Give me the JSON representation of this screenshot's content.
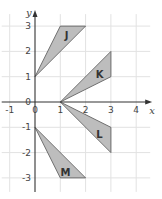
{
  "diagram": {
    "type": "coordinate-grid",
    "x_axis": {
      "label": "x",
      "range": [
        -1,
        4
      ],
      "ticks": [
        "-1",
        "0",
        "1",
        "2",
        "3",
        "4"
      ],
      "tick_values": [
        -1,
        0,
        1,
        2,
        3,
        4
      ]
    },
    "y_axis": {
      "label": "y",
      "range": [
        -3,
        3
      ],
      "ticks": [
        "-3",
        "-2",
        "-1",
        "0",
        "1",
        "2",
        "3"
      ],
      "tick_values": [
        -3,
        -2,
        -1,
        0,
        1,
        2,
        3
      ]
    },
    "shape_fill": "#bdbdbd",
    "shapes": [
      {
        "name": "J",
        "vertices": [
          [
            0,
            1
          ],
          [
            1,
            3
          ],
          [
            2,
            3
          ]
        ],
        "label_at": [
          1.25,
          2.6
        ]
      },
      {
        "name": "K",
        "vertices": [
          [
            1,
            0
          ],
          [
            3,
            2
          ],
          [
            3,
            1
          ]
        ],
        "label_at": [
          2.55,
          1.05
        ]
      },
      {
        "name": "L",
        "vertices": [
          [
            1,
            0
          ],
          [
            3,
            -1
          ],
          [
            3,
            -2
          ]
        ],
        "label_at": [
          2.55,
          -1.3
        ]
      },
      {
        "name": "M",
        "vertices": [
          [
            0,
            -1
          ],
          [
            1,
            -3
          ],
          [
            2,
            -3
          ]
        ],
        "label_at": [
          1.2,
          -2.8
        ]
      }
    ]
  }
}
